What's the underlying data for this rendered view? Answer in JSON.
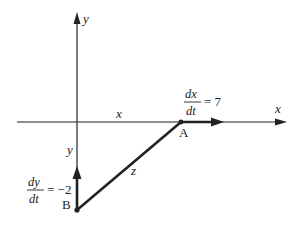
{
  "diagram": {
    "type": "related-rates-triangle",
    "colors": {
      "ink": "#222222",
      "background": "#ffffff"
    },
    "axes": {
      "x_label": "x",
      "y_label": "y"
    },
    "segments": {
      "horizontal_label": "x",
      "vertical_label": "y",
      "hypotenuse_label": "z"
    },
    "points": {
      "A": {
        "label": "A"
      },
      "B": {
        "label": "B"
      }
    },
    "rates": {
      "dx_dt": {
        "numerator": "dx",
        "denominator": "dt",
        "equals": "= 7"
      },
      "dy_dt": {
        "numerator": "dy",
        "denominator": "dt",
        "equals": "= −2"
      }
    }
  }
}
